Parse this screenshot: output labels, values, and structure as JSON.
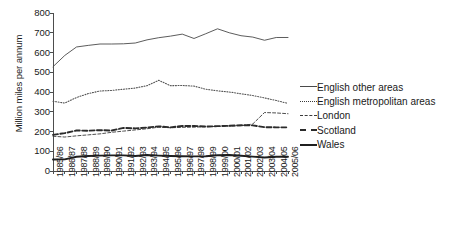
{
  "chart_data": {
    "type": "line",
    "title": "",
    "xlabel": "",
    "ylabel": "Million miles per annum",
    "ylim": [
      0,
      800
    ],
    "yticks": [
      0,
      100,
      200,
      300,
      400,
      500,
      600,
      700,
      800
    ],
    "grid": false,
    "legend_position": "right",
    "categories": [
      "1985/86",
      "1986/87",
      "1987/88",
      "1988/89",
      "1989/90",
      "1990/91",
      "1991/92",
      "1992/93",
      "1993/94",
      "1994/95",
      "1995/96",
      "1996/97",
      "1997/98",
      "1998/99",
      "1999/00",
      "2000/01",
      "2001/02",
      "2002/03",
      "2003/04",
      "2004/05",
      "2005/06"
    ],
    "series": [
      {
        "name": "English other areas",
        "style": "solid",
        "color": "#4a4a4a",
        "values": [
          528,
          585,
          628,
          636,
          643,
          643,
          644,
          648,
          664,
          675,
          683,
          693,
          671,
          695,
          720,
          700,
          685,
          678,
          662,
          676,
          676
        ]
      },
      {
        "name": "English metropolitan areas",
        "style": "dotted",
        "color": "#555555",
        "values": [
          353,
          344,
          372,
          392,
          405,
          408,
          414,
          420,
          432,
          459,
          432,
          433,
          430,
          414,
          406,
          400,
          391,
          382,
          370,
          357,
          342
        ]
      },
      {
        "name": "London",
        "style": "dashed",
        "color": "#3a3a3a",
        "values": [
          176,
          172,
          178,
          183,
          188,
          196,
          202,
          208,
          214,
          222,
          219,
          221,
          222,
          224,
          226,
          228,
          229,
          238,
          296,
          294,
          290
        ]
      },
      {
        "name": "Scotland",
        "style": "dash-bold",
        "color": "#2b2b2b",
        "values": [
          183,
          192,
          205,
          204,
          207,
          205,
          218,
          216,
          220,
          226,
          221,
          228,
          228,
          225,
          227,
          229,
          232,
          231,
          222,
          221,
          221
        ]
      },
      {
        "name": "Wales",
        "style": "solid-bold",
        "color": "#1f1f1f",
        "values": [
          58,
          59,
          72,
          76,
          78,
          79,
          79,
          76,
          81,
          78,
          76,
          75,
          74,
          75,
          80,
          81,
          77,
          73,
          68,
          72,
          72
        ]
      }
    ]
  },
  "legend": {
    "items": [
      {
        "label": "English other areas"
      },
      {
        "label": "English metropolitan areas"
      },
      {
        "label": "London"
      },
      {
        "label": "Scotland"
      },
      {
        "label": "Wales"
      }
    ]
  }
}
